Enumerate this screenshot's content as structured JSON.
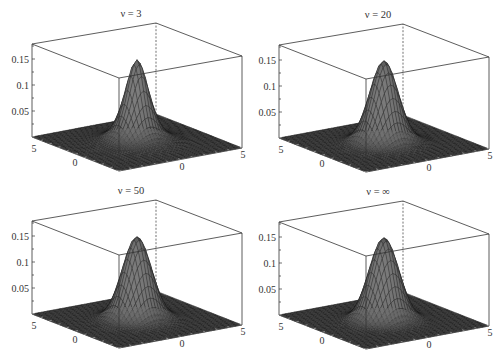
{
  "chart_data": [
    {
      "type": "surface",
      "title": "ν = 3",
      "nu": 3,
      "x_range": [
        -5,
        5
      ],
      "y_range": [
        -5,
        5
      ],
      "z_range": [
        0,
        0.18
      ],
      "x_tick_labels": [
        "0",
        "5"
      ],
      "y_tick_labels": [
        "5",
        "0"
      ],
      "z_ticks": [
        0.05,
        0.1,
        0.15
      ],
      "z_tick_labels": [
        "0.15",
        "0.1",
        "0.05"
      ],
      "peak": {
        "x": 0,
        "y": 0,
        "z": 0.159
      },
      "radial_profile": {
        "r": [
          0,
          0.5,
          1,
          1.5,
          2,
          2.5,
          3,
          4,
          5
        ],
        "z": [
          0.159,
          0.13,
          0.078,
          0.039,
          0.019,
          0.01,
          0.005,
          0.002,
          0.001
        ]
      },
      "box": true,
      "grid": false
    },
    {
      "type": "surface",
      "title": "ν = 20",
      "nu": 20,
      "x_range": [
        -5,
        5
      ],
      "y_range": [
        -5,
        5
      ],
      "z_range": [
        0,
        0.18
      ],
      "x_tick_labels": [
        "0",
        "5"
      ],
      "y_tick_labels": [
        "5",
        "0"
      ],
      "z_ticks": [
        0.05,
        0.1,
        0.15
      ],
      "z_tick_labels": [
        "0.15",
        "0.1",
        "0.05"
      ],
      "peak": {
        "x": 0,
        "y": 0,
        "z": 0.159
      },
      "radial_profile": {
        "r": [
          0,
          0.5,
          1,
          1.5,
          2,
          2.5,
          3,
          4,
          5
        ],
        "z": [
          0.159,
          0.139,
          0.093,
          0.049,
          0.021,
          0.008,
          0.003,
          0.0,
          0.0
        ]
      },
      "box": true,
      "grid": false
    },
    {
      "type": "surface",
      "title": "ν = 50",
      "nu": 50,
      "x_range": [
        -5,
        5
      ],
      "y_range": [
        -5,
        5
      ],
      "z_range": [
        0,
        0.18
      ],
      "x_tick_labels": [
        "0",
        "5"
      ],
      "y_tick_labels": [
        "5",
        "0"
      ],
      "z_ticks": [
        0.05,
        0.1,
        0.15
      ],
      "z_tick_labels": [
        "0.15",
        "0.1",
        "0.05"
      ],
      "peak": {
        "x": 0,
        "y": 0,
        "z": 0.159
      },
      "radial_profile": {
        "r": [
          0,
          0.5,
          1,
          1.5,
          2,
          2.5,
          3,
          4,
          5
        ],
        "z": [
          0.159,
          0.14,
          0.095,
          0.051,
          0.022,
          0.007,
          0.002,
          0.0,
          0.0
        ]
      },
      "box": true,
      "grid": false
    },
    {
      "type": "surface",
      "title": "ν = ∞",
      "nu": "inf",
      "x_range": [
        -5,
        5
      ],
      "y_range": [
        -5,
        5
      ],
      "z_range": [
        0,
        0.18
      ],
      "x_tick_labels": [
        "0",
        "5"
      ],
      "y_tick_labels": [
        "5",
        "0"
      ],
      "z_ticks": [
        0.05,
        0.1,
        0.15
      ],
      "z_tick_labels": [
        "0.15",
        "0.1",
        "0.05"
      ],
      "peak": {
        "x": 0,
        "y": 0,
        "z": 0.159
      },
      "radial_profile": {
        "r": [
          0,
          0.5,
          1,
          1.5,
          2,
          2.5,
          3,
          4,
          5
        ],
        "z": [
          0.159,
          0.14,
          0.097,
          0.052,
          0.022,
          0.007,
          0.002,
          0.0,
          0.0
        ]
      },
      "box": true,
      "grid": false
    }
  ]
}
